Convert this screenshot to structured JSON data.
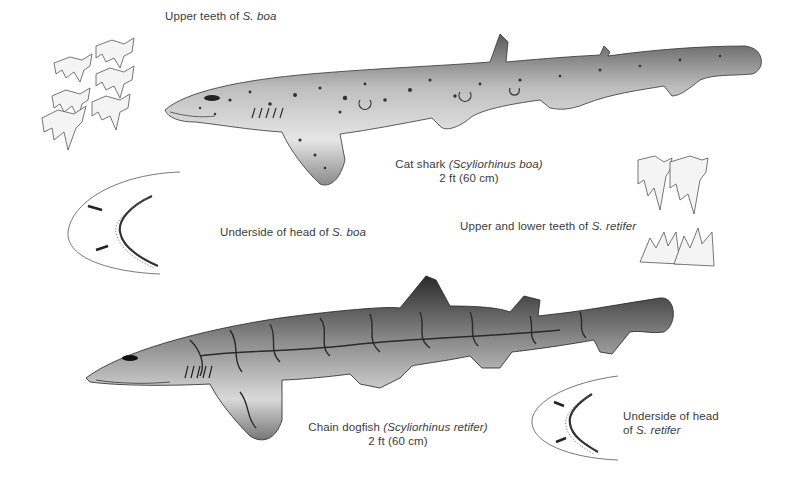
{
  "plate": {
    "captions": {
      "upper_teeth_boa": {
        "prefix": "Upper teeth of ",
        "species": "S. boa"
      },
      "cat_shark": {
        "common": "Cat shark ",
        "scientific": "(Scyliorhinus boa)",
        "size": "2 ft (60 cm)"
      },
      "underside_head_boa": {
        "prefix": "Underside of head of ",
        "species": "S. boa"
      },
      "teeth_retifer": {
        "prefix": "Upper and lower teeth of ",
        "species": "S. retifer"
      },
      "chain_dogfish": {
        "common": "Chain dogfish ",
        "scientific": "(Scyliorhinus retifer)",
        "size": "2 ft (60 cm)"
      },
      "underside_head_retifer": {
        "line1": "Underside of head",
        "prefix": "of ",
        "species": "S. retifer"
      }
    },
    "illustrations": [
      "upper-teeth-boa-drawing",
      "cat-shark-drawing",
      "underside-head-boa-drawing",
      "teeth-retifer-drawing",
      "chain-dogfish-drawing",
      "underside-head-retifer-drawing"
    ],
    "colors": {
      "ink": "#3b3b3b",
      "line": "#555555",
      "body_light": "#d8d8d8",
      "body_dark": "#2a2a2a"
    }
  }
}
